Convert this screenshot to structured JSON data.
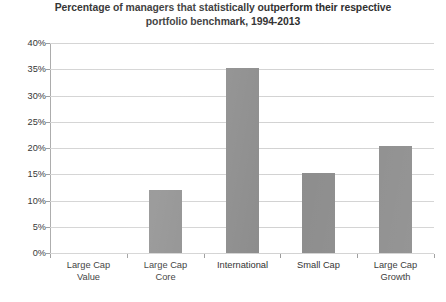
{
  "chart_data": {
    "type": "bar",
    "title": "Percentage of managers that statistically outperform their respective portfolio benchmark, 1994-2013",
    "title_lines": [
      "Percentage of managers that statistically outperform their respective",
      "portfolio benchmark, 1994-2013"
    ],
    "categories": [
      "Large Cap Value",
      "Large Cap Core",
      "International",
      "Small Cap",
      "Large Cap Growth"
    ],
    "category_lines": [
      [
        "Large Cap",
        "Value"
      ],
      [
        "Large Cap",
        "Core"
      ],
      [
        "International"
      ],
      [
        "Small Cap"
      ],
      [
        "Large Cap",
        "Growth"
      ]
    ],
    "values": [
      0,
      12,
      35.2,
      15.3,
      20.3
    ],
    "xlabel": "",
    "ylabel": "",
    "ylim": [
      0,
      40
    ],
    "ytick_values": [
      0,
      5,
      10,
      15,
      20,
      25,
      30,
      35,
      40
    ],
    "ytick_labels": [
      "0%",
      "5%",
      "10%",
      "15%",
      "20%",
      "25%",
      "30%",
      "35%",
      "40%"
    ],
    "grid": true,
    "legend": false,
    "bar_color": "#8c8c8c",
    "gridline_color": "#d2d2d2",
    "axis_color": "#a8a8a8",
    "background_color": "#ffffff",
    "text_color": "#2e2e2e"
  }
}
